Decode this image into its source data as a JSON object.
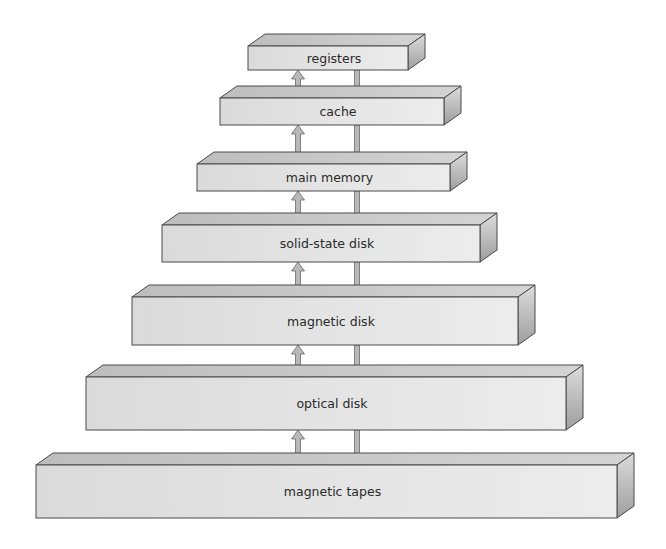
{
  "diagram": {
    "levels": [
      {
        "label": "registers",
        "x1": 248,
        "x2": 408,
        "y1": 46,
        "y2": 70
      },
      {
        "label": "cache",
        "x1": 220,
        "x2": 444,
        "y1": 98,
        "y2": 125
      },
      {
        "label": "main memory",
        "x1": 197,
        "x2": 450,
        "y1": 164,
        "y2": 191
      },
      {
        "label": "solid-state disk",
        "x1": 162,
        "x2": 480,
        "y1": 225,
        "y2": 262
      },
      {
        "label": "magnetic disk",
        "x1": 132,
        "x2": 518,
        "y1": 297,
        "y2": 345
      },
      {
        "label": "optical disk",
        "x1": 86,
        "x2": 566,
        "y1": 377,
        "y2": 430
      },
      {
        "label": "magnetic tapes",
        "x1": 36,
        "x2": 617,
        "y1": 465,
        "y2": 518
      }
    ],
    "depth": {
      "dx": 17,
      "dy": 12
    },
    "arrows": {
      "up_x": 298,
      "down_x": 357
    },
    "colors": {
      "front": "#e2e2e2",
      "top": "#c9c9c9",
      "side_light": "#d8d8d8",
      "side_dark": "#a9a9a9",
      "stroke": "#4a4a4a",
      "arrow_fill": "#b8b8b8",
      "text": "#2a2a2a"
    }
  }
}
